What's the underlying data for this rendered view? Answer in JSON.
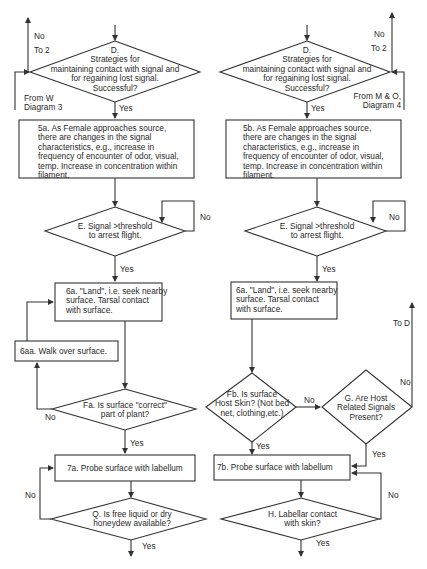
{
  "diagram": {
    "type": "flowchart",
    "left": {
      "D": {
        "lines": [
          "D.",
          "Strategies for",
          "maintaining contact with signal and",
          "for regaining lost signal.",
          "Successful?"
        ]
      },
      "D_no_label": "No",
      "D_to": "To 2",
      "D_from": [
        "From W",
        "Diagram 3"
      ],
      "D_yes": "Yes",
      "step5": {
        "lines": [
          "5a.  As Female approaches source,",
          "there are changes in the signal",
          "characteristics, e.g., increase in",
          "frequency of encounter of odor, visual,",
          "temp.  Increase in concentration within",
          "filament."
        ]
      },
      "E": {
        "lines": [
          "E.  Signal >threshold",
          "to arrest flight."
        ]
      },
      "E_no": "No",
      "E_yes": "Yes",
      "step6": {
        "lines": [
          "6a. \"Land\", i.e. seek nearby",
          "surface.  Tarsal contact",
          "with surface."
        ]
      },
      "step6aa": "6aa. Walk over surface.",
      "F": {
        "lines": [
          "Fa. Is surface \"correct\"",
          "part of plant?"
        ]
      },
      "F_no": "No",
      "F_yes": "Yes",
      "step7": "7a.  Probe surface with labellum",
      "Q": {
        "lines": [
          "Q. Is free liquid or dry",
          "honeydew available?"
        ]
      },
      "Q_no": "No",
      "Q_yes": "Yes"
    },
    "right": {
      "D": {
        "lines": [
          "D.",
          "Strategies for",
          "maintaining contact with signal and",
          "for regaining lost signal.",
          "Successful?"
        ]
      },
      "D_no_label": "No",
      "D_to": "To 2",
      "D_from": [
        "From M & O,",
        "Diagram 4"
      ],
      "D_yes": "Yes",
      "step5": {
        "lines": [
          "5b.  As Female approaches source,",
          "there are changes in the signal",
          "characteristics, e.g., increase in",
          "frequency of encounter of odor, visual,",
          "temp.  Increase in concentration within",
          "filament."
        ]
      },
      "E": {
        "lines": [
          "E.  Signal >threshold",
          "to arrest flight."
        ]
      },
      "E_no": "No",
      "E_yes": "Yes",
      "step6": {
        "lines": [
          "6a. \"Land\", i.e. seek nearby",
          "surface.  Tarsal contact",
          "with surface."
        ]
      },
      "F": {
        "lines": [
          "Fb. Is surface",
          "Host Skin? (Not bed",
          "net, clothing,etc.)"
        ]
      },
      "F_no": "No",
      "F_yes": "Yes",
      "G": {
        "lines": [
          "G. Are Host",
          "Related Signals",
          "Present?"
        ]
      },
      "G_no": "No",
      "G_to": "To D",
      "G_yes": "Yes",
      "step7": "7b.  Probe surface with labellum",
      "H": {
        "lines": [
          "H. Labellar contact",
          "with skin?"
        ]
      },
      "H_no": "No",
      "H_yes": "Yes"
    }
  }
}
